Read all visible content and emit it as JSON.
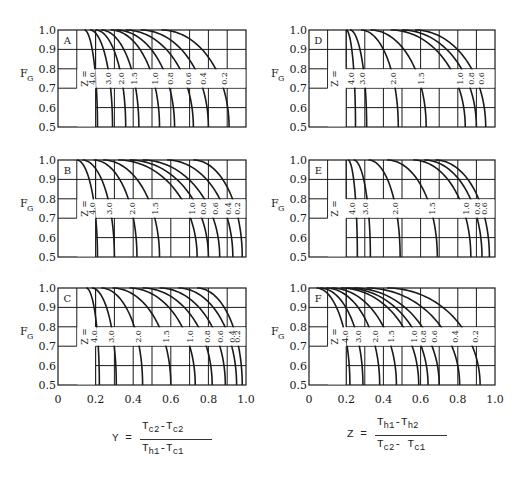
{
  "chart_data": [
    {
      "type": "line",
      "panel": "A",
      "title": "A",
      "xlabel": "Y",
      "ylabel": "F_G",
      "xlim": [
        0,
        1.0
      ],
      "ylim": [
        0.5,
        1.0
      ],
      "grid": true,
      "z_label": "Z =",
      "series": [
        {
          "name": "4.0",
          "x_start": 0.14,
          "x_end": 0.21
        },
        {
          "name": "3.0",
          "x_start": 0.17,
          "x_end": 0.29
        },
        {
          "name": "2.0",
          "x_start": 0.2,
          "x_end": 0.36
        },
        {
          "name": "1.5",
          "x_start": 0.23,
          "x_end": 0.43
        },
        {
          "name": "1.0",
          "x_start": 0.28,
          "x_end": 0.54
        },
        {
          "name": "0.8",
          "x_start": 0.31,
          "x_end": 0.62
        },
        {
          "name": "0.6",
          "x_start": 0.36,
          "x_end": 0.72
        },
        {
          "name": "0.4",
          "x_start": 0.44,
          "x_end": 0.8
        },
        {
          "name": "0.2",
          "x_start": 0.55,
          "x_end": 0.91
        }
      ]
    },
    {
      "type": "line",
      "panel": "B",
      "title": "B",
      "xlabel": "Y",
      "ylabel": "F_G",
      "xlim": [
        0,
        1.0
      ],
      "ylim": [
        0.5,
        1.0
      ],
      "grid": true,
      "z_label": "Z =",
      "series": [
        {
          "name": "4.0",
          "x_start": 0.1,
          "x_end": 0.21
        },
        {
          "name": "3.0",
          "x_start": 0.13,
          "x_end": 0.3
        },
        {
          "name": "2.0",
          "x_start": 0.19,
          "x_end": 0.42
        },
        {
          "name": "1.5",
          "x_start": 0.24,
          "x_end": 0.54
        },
        {
          "name": "1.0",
          "x_start": 0.32,
          "x_end": 0.74
        },
        {
          "name": "0.8",
          "x_start": 0.38,
          "x_end": 0.8
        },
        {
          "name": "0.6",
          "x_start": 0.45,
          "x_end": 0.86
        },
        {
          "name": "0.4",
          "x_start": 0.58,
          "x_end": 0.93
        },
        {
          "name": "0.2",
          "x_start": 0.72,
          "x_end": 0.98
        }
      ]
    },
    {
      "type": "line",
      "panel": "C",
      "title": "C",
      "xlabel": "Y",
      "ylabel": "F_G",
      "xlim": [
        0,
        1.0
      ],
      "ylim": [
        0.5,
        1.0
      ],
      "grid": true,
      "z_label": "Z =",
      "series": [
        {
          "name": "4.0",
          "x_start": 0.15,
          "x_end": 0.22
        },
        {
          "name": "3.0",
          "x_start": 0.18,
          "x_end": 0.31
        },
        {
          "name": "2.0",
          "x_start": 0.23,
          "x_end": 0.45
        },
        {
          "name": "1.5",
          "x_start": 0.29,
          "x_end": 0.6
        },
        {
          "name": "1.0",
          "x_start": 0.38,
          "x_end": 0.73
        },
        {
          "name": "0.8",
          "x_start": 0.45,
          "x_end": 0.82
        },
        {
          "name": "0.6",
          "x_start": 0.54,
          "x_end": 0.89
        },
        {
          "name": "0.4",
          "x_start": 0.64,
          "x_end": 0.95
        },
        {
          "name": "0.2",
          "x_start": 0.74,
          "x_end": 0.98
        }
      ]
    },
    {
      "type": "line",
      "panel": "D",
      "title": "D",
      "xlabel": "Y",
      "ylabel": "F_G",
      "xlim": [
        0,
        1.0
      ],
      "ylim": [
        0.5,
        1.0
      ],
      "grid": true,
      "z_label": "Z =",
      "series": [
        {
          "name": "4.0",
          "x_start": 0.2,
          "x_end": 0.25
        },
        {
          "name": "3.0",
          "x_start": 0.22,
          "x_end": 0.31
        },
        {
          "name": "2.0",
          "x_start": 0.28,
          "x_end": 0.48
        },
        {
          "name": "1.5",
          "x_start": 0.33,
          "x_end": 0.63
        },
        {
          "name": "1.0",
          "x_start": 0.44,
          "x_end": 0.84
        },
        {
          "name": "0.8",
          "x_start": 0.5,
          "x_end": 0.9
        },
        {
          "name": "0.6",
          "x_start": 0.57,
          "x_end": 0.95
        }
      ]
    },
    {
      "type": "line",
      "panel": "E",
      "title": "E",
      "xlabel": "Y",
      "ylabel": "F_G",
      "xlim": [
        0,
        1.0
      ],
      "ylim": [
        0.5,
        1.0
      ],
      "grid": true,
      "z_label": "Z =",
      "series": [
        {
          "name": "4.0",
          "x_start": 0.21,
          "x_end": 0.26
        },
        {
          "name": "3.0",
          "x_start": 0.24,
          "x_end": 0.33
        },
        {
          "name": "2.0",
          "x_start": 0.32,
          "x_end": 0.49
        },
        {
          "name": "1.5",
          "x_start": 0.42,
          "x_end": 0.69
        },
        {
          "name": "1.0",
          "x_start": 0.56,
          "x_end": 0.87
        },
        {
          "name": "0.8",
          "x_start": 0.62,
          "x_end": 0.93
        },
        {
          "name": "0.6",
          "x_start": 0.68,
          "x_end": 0.97
        }
      ]
    },
    {
      "type": "line",
      "panel": "F",
      "title": "F",
      "xlabel": "Z",
      "ylabel": "F_G",
      "xlim": [
        0,
        1.0
      ],
      "ylim": [
        0.5,
        1.0
      ],
      "grid": true,
      "z_label": "Z =",
      "series": [
        {
          "name": "4.0",
          "x_start": 0.04,
          "x_end": 0.22
        },
        {
          "name": "3.0",
          "x_start": 0.06,
          "x_end": 0.29
        },
        {
          "name": "2.0",
          "x_start": 0.09,
          "x_end": 0.38
        },
        {
          "name": "1.5",
          "x_start": 0.12,
          "x_end": 0.47
        },
        {
          "name": "1.0",
          "x_start": 0.17,
          "x_end": 0.59
        },
        {
          "name": "0.8",
          "x_start": 0.2,
          "x_end": 0.64
        },
        {
          "name": "0.6",
          "x_start": 0.24,
          "x_end": 0.7
        },
        {
          "name": "0.4",
          "x_start": 0.31,
          "x_end": 0.81
        },
        {
          "name": "0.2",
          "x_start": 0.42,
          "x_end": 0.92
        }
      ]
    }
  ],
  "axes": {
    "y_ticks": [
      "1.0",
      "0.9",
      "0.8",
      "0.7",
      "0.6",
      "0.5"
    ],
    "x_ticks": [
      "0",
      "0.2",
      "0.4",
      "0.6",
      "0.8",
      "1.0"
    ],
    "y_axis_label": "F",
    "y_axis_label_sub": "G"
  },
  "formulas": {
    "left": {
      "lhs": "Y =",
      "num": "T",
      "num_sub1": "c2",
      "num_mid": "-T",
      "num_sub2": "c2",
      "den": "T",
      "den_sub1": "h1",
      "den_mid": "-T",
      "den_sub2": "c1"
    },
    "right": {
      "lhs": "Z =",
      "num": "T",
      "num_sub1": "h1",
      "num_mid": "-T",
      "num_sub2": "h2",
      "den": "T",
      "den_sub1": "c2",
      "den_mid": "- T",
      "den_sub2": "c1"
    }
  },
  "colors": {
    "ink": "#1a1a1a",
    "paper": "#ffffff"
  }
}
